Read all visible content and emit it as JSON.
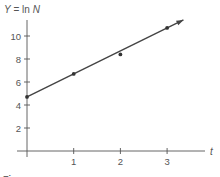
{
  "chart_data": {
    "type": "scatter",
    "title": "",
    "ylabel_parts": [
      "Y",
      " = ln ",
      "N"
    ],
    "xlabel": "t",
    "x_ticks": [
      1,
      2,
      3
    ],
    "y_ticks": [
      2,
      4,
      6,
      8,
      10
    ],
    "xlim": [
      0,
      3.8
    ],
    "ylim": [
      0,
      11
    ],
    "grid": false,
    "points": [
      {
        "x": 0,
        "y": 4.7
      },
      {
        "x": 1,
        "y": 6.7
      },
      {
        "x": 2,
        "y": 8.4
      },
      {
        "x": 3,
        "y": 10.7
      }
    ],
    "fit_line": {
      "intercept": 4.7,
      "slope": 2.0,
      "x_end": 3.35,
      "arrow": true
    },
    "caption": "Figure"
  }
}
